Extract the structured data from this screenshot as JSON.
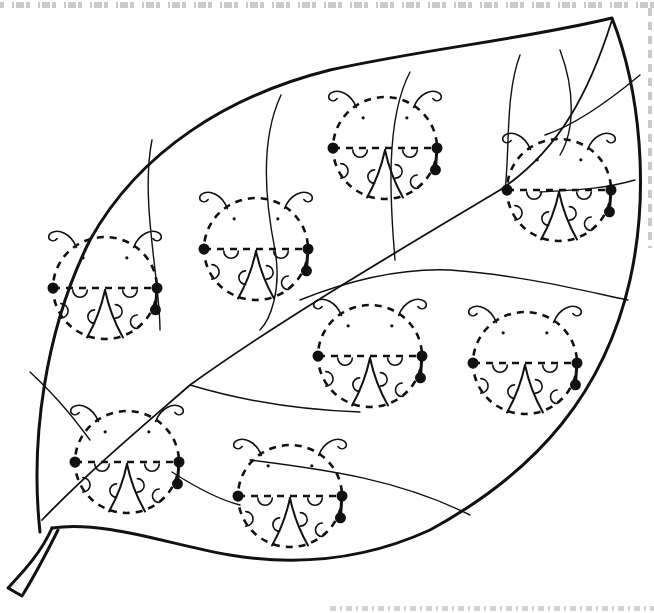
{
  "worksheet": {
    "subject": "leaf with ladybugs tracing activity",
    "stroke_color": "#111111",
    "background_color": "#ffffff",
    "ladybug_count": 8
  },
  "ladybugs": [
    {
      "id": "ladybug-1",
      "cx": 105,
      "cy": 288,
      "r": 52
    },
    {
      "id": "ladybug-2",
      "cx": 256,
      "cy": 249,
      "r": 52
    },
    {
      "id": "ladybug-3",
      "cx": 385,
      "cy": 148,
      "r": 52
    },
    {
      "id": "ladybug-4",
      "cx": 559,
      "cy": 190,
      "r": 52
    },
    {
      "id": "ladybug-5",
      "cx": 370,
      "cy": 356,
      "r": 52
    },
    {
      "id": "ladybug-6",
      "cx": 525,
      "cy": 363,
      "r": 52
    },
    {
      "id": "ladybug-7",
      "cx": 127,
      "cy": 462,
      "r": 52
    },
    {
      "id": "ladybug-8",
      "cx": 290,
      "cy": 496,
      "r": 52
    }
  ]
}
